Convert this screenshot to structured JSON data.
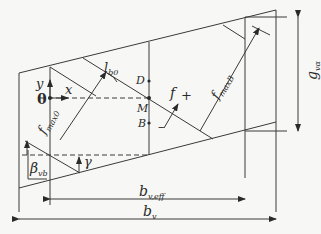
{
  "diagram": {
    "labels": {
      "y_axis": "y",
      "x_axis": "x",
      "origin": "0",
      "l_b0": "l",
      "l_b0_sub": "b0",
      "D": "D",
      "M": "M",
      "B": "B",
      "f_max0": "f",
      "f_max0_sub": "max0",
      "f": "f",
      "plus": "+",
      "minus": "–",
      "f_maxB": "f",
      "f_maxB_sub": "maxB",
      "g_va": "g",
      "g_va_sub": "vα",
      "beta_vb": "β",
      "beta_vb_sub": "vb",
      "gamma": "γ",
      "b_veff": "b",
      "b_veff_sub": "v,eff",
      "b_v": "b",
      "b_v_sub": "v"
    },
    "colors": {
      "line": "#3a3a3a",
      "background": "#f7f7f5"
    }
  }
}
